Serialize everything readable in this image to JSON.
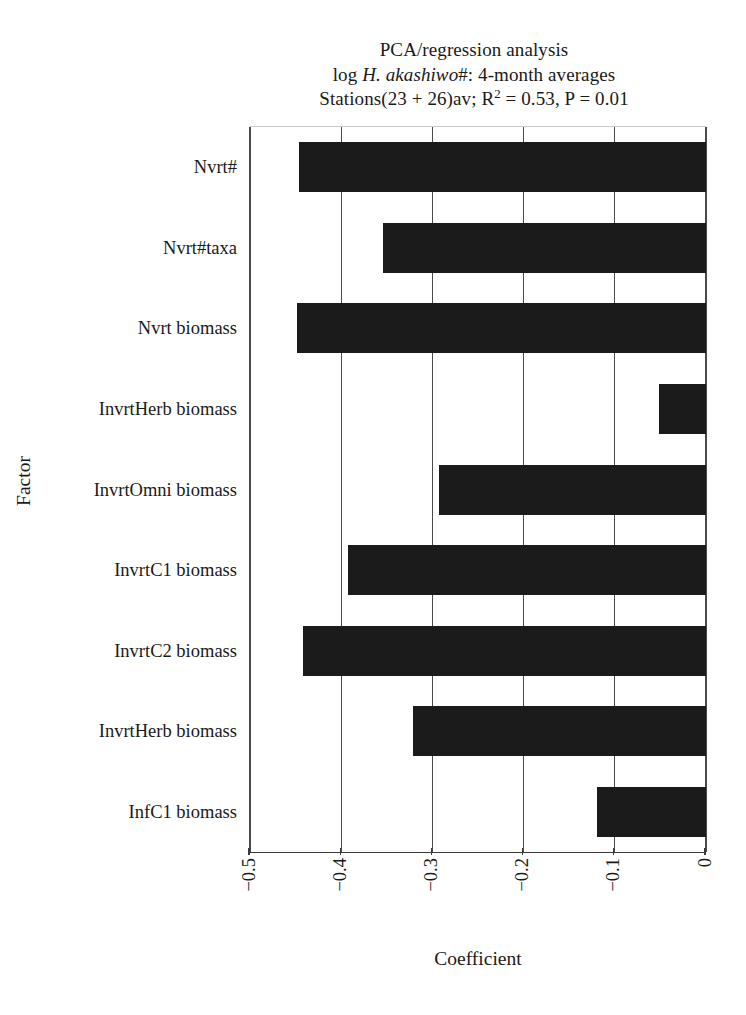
{
  "chart_data": {
    "type": "bar",
    "orientation": "horizontal",
    "title_lines": [
      "PCA/regression analysis",
      "log H. akashiwo#: 4-month averages",
      "Stations(23 + 26)av; R2 = 0.53, P = 0.01"
    ],
    "title_line1": "PCA/regression analysis",
    "title_line2_pre": "log ",
    "title_line2_italic": "H. akashiwo",
    "title_line2_post": "#: 4-month averages",
    "title_line3_pre": "Stations(23 + 26)av; R",
    "title_line3_sup": "2",
    "title_line3_post": " = 0.53, P = 0.01",
    "xlabel": "Coefficient",
    "ylabel": "Factor",
    "categories": [
      "Nvrt#",
      "Nvrt#taxa",
      "Nvrt biomass",
      "InvrtHerb biomass",
      "InvrtOmni biomass",
      "InvrtC1 biomass",
      "InvrtC2 biomass",
      "InvrtHerb biomass",
      "InfC1 biomass"
    ],
    "values": [
      -0.446,
      -0.354,
      -0.448,
      -0.052,
      -0.293,
      -0.392,
      -0.442,
      -0.321,
      -0.12
    ],
    "xlim": [
      -0.5,
      0
    ],
    "ylim_note": "categorical",
    "xticks": [
      -0.5,
      -0.4,
      -0.3,
      -0.2,
      -0.1,
      0
    ],
    "xtick_labels": [
      "-0.5",
      "-0.4",
      "-0.3",
      "-0.2",
      "-0.1",
      "0"
    ],
    "grid": "vertical gridlines at each x tick",
    "legend": "none",
    "bar_color": "#1b1b1b",
    "axis_color": "#3a3a3a",
    "r_squared": 0.53,
    "p_value": 0.01
  }
}
